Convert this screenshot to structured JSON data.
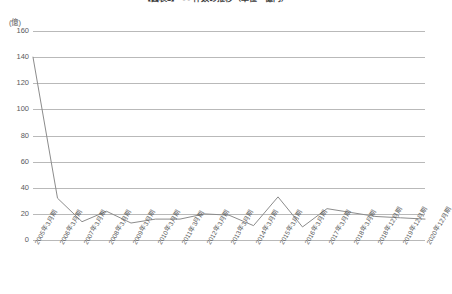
{
  "chart_data": {
    "type": "line",
    "title": "【図表1】 ○○ 件数の推移（単位・億円）",
    "unit_label": "(億)",
    "xlabel": "",
    "ylabel": "",
    "ylim": [
      0,
      160
    ],
    "ytick_step": 20,
    "yticks": [
      160,
      140,
      120,
      100,
      80,
      60,
      40,
      20,
      0
    ],
    "grid": true,
    "legend": "none",
    "line_color": "#8c8c8c",
    "grid_color": "#b9b9b9",
    "categories": [
      "2005年3月期",
      "2006年3月期",
      "2007年3月期",
      "2008年3月期",
      "2009年3月期",
      "2010年3月期",
      "2011年3月期",
      "2012年3月期",
      "2013年3月期",
      "2014年3月期",
      "2015年3月期",
      "2016年3月期",
      "2017年3月期",
      "2018年3月期",
      "2018年12月期",
      "2019年12月期",
      "2020年12月期"
    ],
    "values": [
      140,
      32,
      14,
      22,
      13,
      16,
      16,
      20,
      19,
      11,
      33,
      10,
      24,
      21,
      18,
      17,
      16
    ]
  }
}
